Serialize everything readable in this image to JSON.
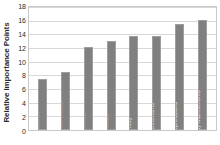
{
  "chart_data": {
    "type": "bar",
    "title": "",
    "xlabel": "",
    "ylabel": "Relative Importance Points",
    "ylim": [
      0,
      18
    ],
    "yticks": [
      0,
      2,
      4,
      6,
      8,
      10,
      12,
      14,
      16,
      18
    ],
    "grid": true,
    "legend": false,
    "bar_color": "#808080",
    "categories": [
      "Appearance",
      "Appearance Choice",
      "Proxemics",
      "Eye Gaze",
      "Identity",
      "Body Mannerisms",
      "Facial Expressions",
      "Personal Body Mannerisms"
    ],
    "values": [
      7.4,
      8.5,
      12.2,
      13.0,
      13.7,
      13.8,
      15.5,
      16.1
    ]
  }
}
